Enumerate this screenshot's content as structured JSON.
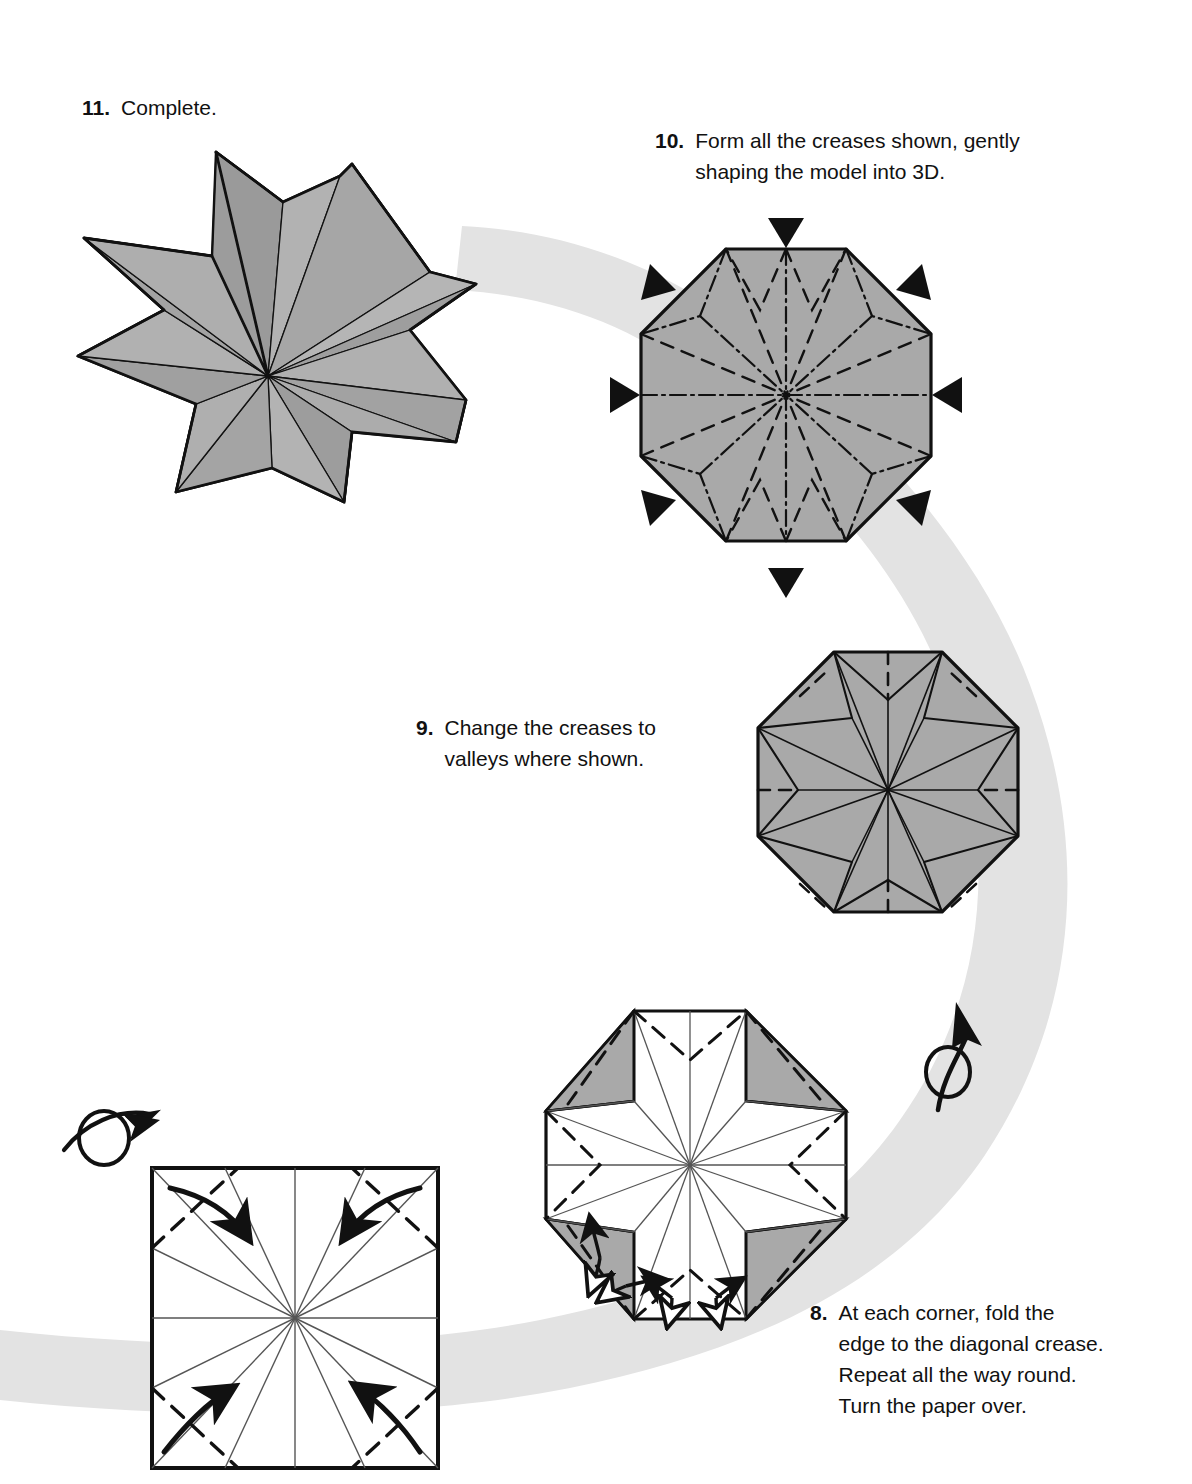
{
  "document": {
    "type": "origami-instruction-diagram",
    "title": "Eight-pointed star origami folding steps",
    "background_color": "#ffffff",
    "ink_color": "#111111",
    "paper_gray": "#a9a9a9",
    "paper_gray_dark": "#8f8f8f",
    "paper_white": "#ffffff",
    "flow_ribbon_color": "#e3e3e3"
  },
  "steps": [
    {
      "id": "step-11",
      "number": "11.",
      "text": "Complete.",
      "figure": "finished-eight-point-star-3d"
    },
    {
      "id": "step-10",
      "number": "10.",
      "text": "Form all the creases shown, gently\nshaping the model into 3D.",
      "figure": "octagon-with-mountain-and-valley-creases",
      "push_arrows": 8
    },
    {
      "id": "step-9",
      "number": "9.",
      "text": "Change the creases to\nvalleys where shown.",
      "figure": "octagon-eight-point-pinwheel"
    },
    {
      "id": "step-8",
      "number": "8.",
      "text": "At each corner, fold the\nedge to the diagonal crease.\nRepeat all the way round.\nTurn the paper over.",
      "figure": "octagon-with-white-cross-and-gray-corners",
      "fold_arrows": 4
    }
  ],
  "symbols": [
    {
      "name": "turn-over-arrow-left",
      "meaning": "Turn the paper over"
    },
    {
      "name": "turn-over-arrow-right",
      "meaning": "Turn the paper over"
    },
    {
      "name": "push-arrow",
      "meaning": "Push here / apply pressure inward"
    },
    {
      "name": "fold-arrow",
      "meaning": "Fold in direction of arrow"
    },
    {
      "name": "pleat-arrow",
      "meaning": "Fold and unfold / pleat"
    }
  ],
  "legend": {
    "mountain_crease": "dash-dot line",
    "valley_crease": "dashed line",
    "existing_crease": "thin solid line",
    "paper_edge": "thick solid line"
  }
}
